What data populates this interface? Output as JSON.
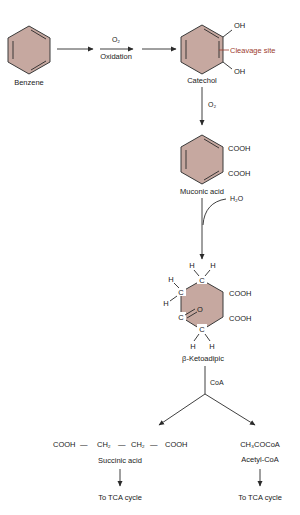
{
  "diagram": {
    "colors": {
      "ring_fill": "#c6a8a0",
      "ring_stroke": "#3a3a3a",
      "cleavage_label": "#9b3b2e",
      "text": "#1a1a1a"
    },
    "nodes": {
      "benzene": {
        "label": "Benzene"
      },
      "catechol": {
        "label": "Catechol",
        "substituents": [
          "OH",
          "OH"
        ],
        "annotation": "Cleavage site"
      },
      "muconic": {
        "label": "Muconic acid",
        "substituents": [
          "COOH",
          "COOH"
        ]
      },
      "ketoadipic": {
        "label": "β-Ketoadipic",
        "atoms": [
          "C",
          "C",
          "C",
          "C",
          "O"
        ],
        "hydrogens": [
          "H",
          "H",
          "H",
          "H",
          "H",
          "H"
        ],
        "substituents": [
          "COOH",
          "COOH"
        ]
      },
      "succinic": {
        "formula_parts": [
          "COOH",
          "—",
          "CH₂",
          "—",
          "CH₂",
          "—",
          "COOH"
        ],
        "label": "Succinic acid",
        "destination": "To TCA cycle"
      },
      "acetyl": {
        "formula": "CH₃COCoA",
        "label": "Acetyl-CoA",
        "destination": "To TCA cycle"
      }
    },
    "steps": {
      "step1": {
        "reagent": "O₂",
        "process": "Oxidation"
      },
      "step2": {
        "reagent": "O₂"
      },
      "step3": {
        "reagent": "H₂O"
      },
      "step4": {
        "reagent": "CoA"
      }
    }
  }
}
